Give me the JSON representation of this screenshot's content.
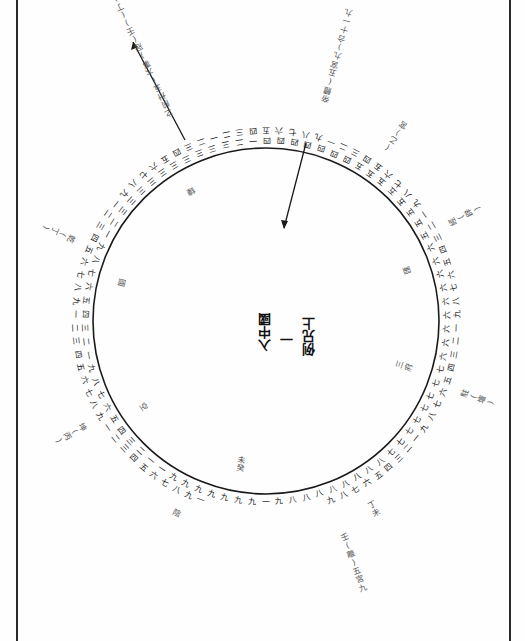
{
  "diagram": {
    "orientation": "rotated-180",
    "center_title": {
      "col1": "例兄上",
      "col2": "一",
      "col3": "入中國"
    },
    "colors": {
      "ink": "#1a1a1a",
      "paper": "#fefefe",
      "frame": "#2a2a2a"
    },
    "radial_labels": [
      {
        "id": "top-left-arrow",
        "text": "之前卅五(大事)冠(壬)(丁)",
        "angle_deg": -25
      },
      {
        "id": "top-center-arrow",
        "text": "帝體(五宮九)合十一九",
        "angle_deg": 15
      },
      {
        "id": "top-right",
        "text": "(乙)宮",
        "angle_deg": 35
      },
      {
        "id": "right-upper",
        "text": "經(辟)",
        "angle_deg": 62
      },
      {
        "id": "right-inner-upper",
        "text": "匯",
        "angle_deg": 70
      },
      {
        "id": "right-lower",
        "text": "駐(壇)",
        "angle_deg": 110
      },
      {
        "id": "right-inner-lower",
        "text": "府三",
        "angle_deg": 108
      },
      {
        "id": "bottom-right",
        "text": "丁未",
        "angle_deg": 150
      },
      {
        "id": "bottom-right-arrow",
        "text": "壬(離)五宮九",
        "angle_deg": 160
      },
      {
        "id": "bottom-center-inner",
        "text": "癸未",
        "angle_deg": 190
      },
      {
        "id": "bottom-left",
        "text": "陰",
        "angle_deg": 205
      },
      {
        "id": "left-lower",
        "text": "坤(丙)",
        "angle_deg": 240
      },
      {
        "id": "left-inner-lower",
        "text": "空",
        "angle_deg": 235
      },
      {
        "id": "left-upper",
        "text": "乾(丁)",
        "angle_deg": 293
      },
      {
        "id": "left-inner-upper",
        "text": "國",
        "angle_deg": 285
      },
      {
        "id": "top-left-inner",
        "text": "鐘",
        "angle_deg": 330
      }
    ],
    "inner_ring": [
      "一",
      "九",
      "九",
      "九",
      "九",
      "九",
      "九",
      "九",
      "一",
      "一",
      "二",
      "三",
      "四",
      "五",
      "六",
      "七",
      "八",
      "九",
      "一",
      "二",
      "三",
      "四",
      "五",
      "六",
      "七",
      "八",
      "九",
      "一",
      "二",
      "三",
      "三",
      "三",
      "三",
      "三",
      "三",
      "三",
      "三",
      "三",
      "三",
      "二",
      "一",
      "四",
      "四",
      "四",
      "四",
      "四",
      "四",
      "四",
      "五",
      "五",
      "五",
      "五",
      "五",
      "五",
      "五",
      "五",
      "六",
      "六",
      "六",
      "六",
      "六",
      "六",
      "六",
      "六",
      "六",
      "七",
      "七",
      "七",
      "七",
      "七",
      "七",
      "七",
      "七",
      "八",
      "八",
      "八",
      "八",
      "八",
      "八",
      "八",
      "八",
      "九"
    ],
    "outer_ring": [
      "一",
      "九",
      "八",
      "七",
      "六",
      "五",
      "四",
      "三",
      "二",
      "一",
      "九",
      "八",
      "七",
      "六",
      "五",
      "四",
      "三",
      "二",
      "一",
      "九",
      "八",
      "七",
      "六",
      "五",
      "四",
      "三",
      "二",
      "一",
      "九",
      "八",
      "七",
      "六",
      "五",
      "四",
      "三",
      "二",
      "一",
      "二",
      "三",
      "四",
      "五",
      "六",
      "七",
      "八",
      "九",
      "一",
      "二",
      "三",
      "四",
      "五",
      "六",
      "七",
      "八",
      "九",
      "一",
      "二",
      "三",
      "四",
      "五",
      "六",
      "七",
      "八",
      "九",
      "一",
      "二",
      "三",
      "四",
      "五",
      "六",
      "七",
      "八",
      "九",
      "一",
      "二",
      "三",
      "四",
      "五",
      "六",
      "七",
      "八",
      "九"
    ]
  }
}
